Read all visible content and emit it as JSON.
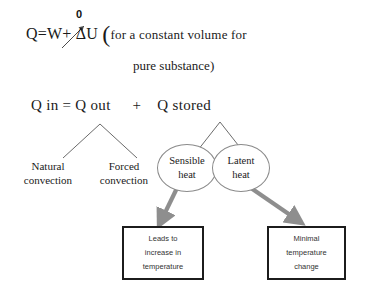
{
  "diagram": {
    "background_color": "#ffffff",
    "equation": {
      "zero_annotation": "0",
      "q_symbol": "Q",
      "equals": "=",
      "w_symbol": "W",
      "plus": "+",
      "delta_u": "ΔU",
      "open_paren": "(",
      "condition_line1": "for a constant volume for",
      "condition_line2": "pure substance)"
    },
    "balance": {
      "q_in": "Q in",
      "equals": "=",
      "q_out": "Q out",
      "plus": "+",
      "q_stored": "Q stored"
    },
    "convection": [
      {
        "line1": "Natural",
        "line2": "convection"
      },
      {
        "line1": "Forced",
        "line2": "convection"
      }
    ],
    "heat_nodes": [
      {
        "line1": "Sensible",
        "line2": "heat",
        "border_color": "#8a8a8a"
      },
      {
        "line1": "Latent",
        "line2": "heat",
        "border_color": "#8a8a8a"
      }
    ],
    "outcomes": [
      {
        "line1": "Leads to",
        "line2": "increase in",
        "line3": "temperature",
        "border_color": "#1c1c1c"
      },
      {
        "line1": "Minimal",
        "line2": "temperature",
        "line3": "change",
        "border_color": "#1c1c1c"
      }
    ],
    "connector_color": "#6b6b6b",
    "arrow_color": "#8e8e8e"
  }
}
